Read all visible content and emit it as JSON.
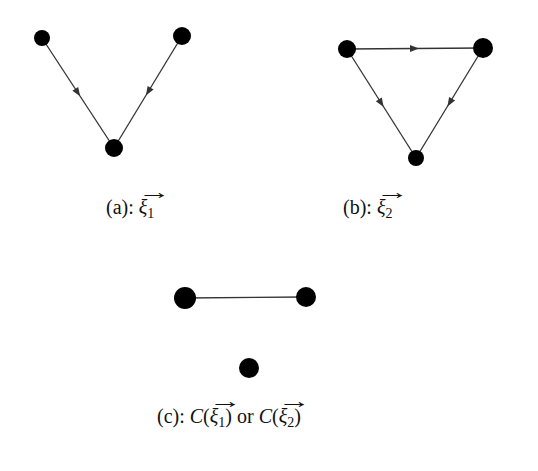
{
  "figure": {
    "panels": [
      {
        "id": "a",
        "caption_prefix": "(a): ",
        "symbol": "ξ",
        "subscript": "1",
        "nodes": [
          {
            "x": 42,
            "y": 38,
            "r": 8
          },
          {
            "x": 182,
            "y": 36,
            "r": 9
          },
          {
            "x": 114,
            "y": 148,
            "r": 9
          }
        ],
        "edges": [
          {
            "from": 0,
            "to": 2,
            "directed": true
          },
          {
            "from": 1,
            "to": 2,
            "directed": true
          }
        ]
      },
      {
        "id": "b",
        "caption_prefix": "(b): ",
        "symbol": "ξ",
        "subscript": "2",
        "nodes": [
          {
            "x": 347,
            "y": 49,
            "r": 9
          },
          {
            "x": 483,
            "y": 48,
            "r": 10
          },
          {
            "x": 416,
            "y": 158,
            "r": 8
          }
        ],
        "edges": [
          {
            "from": 0,
            "to": 1,
            "directed": true
          },
          {
            "from": 0,
            "to": 2,
            "directed": true
          },
          {
            "from": 1,
            "to": 2,
            "directed": true
          }
        ]
      },
      {
        "id": "c",
        "caption_prefix": "(c): ",
        "caption_func": "C",
        "caption_or": " or ",
        "symbol": "ξ",
        "subscript_1": "1",
        "subscript_2": "2",
        "nodes": [
          {
            "x": 185,
            "y": 298,
            "r": 11
          },
          {
            "x": 306,
            "y": 297,
            "r": 10
          },
          {
            "x": 249,
            "y": 368,
            "r": 10
          }
        ],
        "edges": [
          {
            "from": 0,
            "to": 1,
            "directed": false
          }
        ]
      }
    ],
    "colors": {
      "node": "#000000",
      "edge": "#333333",
      "background": "#ffffff"
    }
  }
}
